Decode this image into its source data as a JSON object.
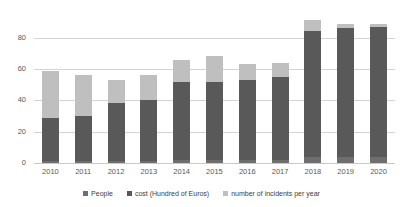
{
  "chart_data": {
    "type": "bar",
    "subtype": "stacked-column",
    "title": "",
    "xlabel": "",
    "ylabel": "",
    "ylim": [
      0,
      90
    ],
    "yticks": [
      0,
      20,
      40,
      60,
      80
    ],
    "grid": true,
    "legend_position": "bottom",
    "categories": [
      "2010",
      "2011",
      "2012",
      "2013",
      "2014",
      "2015",
      "2016",
      "2017",
      "2018",
      "2019",
      "2020"
    ],
    "series": [
      {
        "name": "People",
        "color": "#6e6e6e",
        "values": [
          1,
          1,
          1,
          1,
          2,
          2,
          2,
          2,
          4,
          4,
          4
        ]
      },
      {
        "name": "cost (Hundred of Euros)",
        "color": "#595959",
        "values": [
          28,
          29,
          37,
          39,
          50,
          50,
          51,
          53,
          80,
          82,
          83
        ]
      },
      {
        "name": "number of incidents per year",
        "color": "#bfbfbf",
        "values": [
          30,
          26,
          15,
          16,
          14,
          16,
          10,
          9,
          7,
          3,
          2
        ]
      }
    ],
    "totals": [
      59,
      56,
      53,
      56,
      66,
      68,
      63,
      64,
      91,
      89,
      89
    ]
  },
  "axes": {
    "y_ticks": [
      {
        "label": "80",
        "value": 80
      },
      {
        "label": "60",
        "value": 60
      },
      {
        "label": "40",
        "value": 40
      },
      {
        "label": "20",
        "value": 20
      },
      {
        "label": "0",
        "value": 0
      }
    ],
    "x_ticks": [
      "2010",
      "2011",
      "2012",
      "2013",
      "2014",
      "2015",
      "2016",
      "2017",
      "2018",
      "2019",
      "2020"
    ]
  },
  "legend": {
    "items": [
      {
        "label": "People",
        "color": "#6e6e6e"
      },
      {
        "label": "cost (Hundred of Euros)",
        "color": "#595959"
      },
      {
        "label": "number of incidents per year",
        "color": "#bfbfbf"
      }
    ]
  },
  "colors": {
    "grid": "#d4d4d4",
    "axis_text": "#595959",
    "legend_text": "#404040",
    "background": "#ffffff"
  }
}
